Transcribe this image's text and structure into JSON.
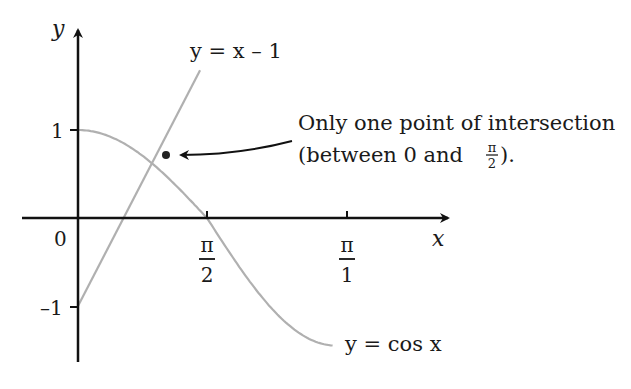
{
  "chart_data": {
    "type": "line",
    "title": "",
    "xlabel": "x",
    "ylabel": "y",
    "x_ticks": [
      {
        "value": 1.5708,
        "label_num": "π",
        "label_den": "2"
      },
      {
        "value": 3.1416,
        "label_num": "π",
        "label_den": "1"
      }
    ],
    "y_ticks": [
      {
        "value": 1,
        "label": "1"
      },
      {
        "value": -1,
        "label": "–1"
      }
    ],
    "origin_label": "0",
    "series": [
      {
        "name": "y = cos x",
        "expr": "cos",
        "x_range": [
          0,
          3.1
        ],
        "color": "#b0b0b0"
      },
      {
        "name": "y = x – 1",
        "expr": "x-1",
        "x_range": [
          0,
          2.9
        ],
        "color": "#b0b0b0"
      }
    ],
    "labels": {
      "line": "y = x – 1",
      "cos": "y = cos x"
    },
    "annotation": {
      "line1": "Only one point of intersection",
      "line2_prefix": "(between 0 and ",
      "frac_num": "π",
      "frac_den": "2",
      "line2_suffix": ")."
    },
    "intersection": {
      "x": 0.74,
      "y": 0.74
    }
  }
}
